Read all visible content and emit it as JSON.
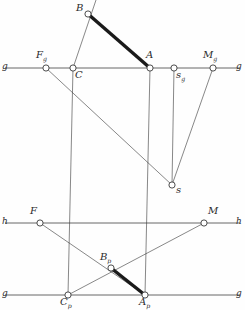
{
  "figure": {
    "type": "descriptive-geometry-construction",
    "width": 245,
    "height": 310,
    "background": "#fefefe",
    "ink_color": "#3a3a3a",
    "thick_color": "#1a1a1a",
    "node_fill": "#ffffff",
    "axes": {
      "g_upper": {
        "label_left": "g",
        "label_right": "g",
        "y": 68,
        "x1": 5,
        "x2": 240
      },
      "h_middle": {
        "label_left": "h",
        "label_right": "h",
        "y": 223,
        "x1": 5,
        "x2": 240
      },
      "g_lower": {
        "label_left": "g",
        "label_right": "g",
        "y": 295,
        "x1": 5,
        "x2": 240
      }
    },
    "points": [
      {
        "name": "B",
        "label": "B",
        "sub": "",
        "x": 88,
        "y": 14,
        "lx": 76,
        "ly": 3
      },
      {
        "name": "Fg",
        "label": "F",
        "sub": "g",
        "x": 46,
        "y": 68,
        "lx": 36,
        "ly": 50
      },
      {
        "name": "C",
        "label": "C",
        "sub": "",
        "x": 73,
        "y": 68,
        "lx": 75,
        "ly": 70
      },
      {
        "name": "A",
        "label": "A",
        "sub": "",
        "x": 150,
        "y": 68,
        "lx": 146,
        "ly": 50
      },
      {
        "name": "sg",
        "label": "s",
        "sub": "g",
        "x": 174,
        "y": 68,
        "lx": 176,
        "ly": 70
      },
      {
        "name": "Mg",
        "label": "M",
        "sub": "g",
        "x": 213,
        "y": 68,
        "lx": 203,
        "ly": 50
      },
      {
        "name": "s",
        "label": "s",
        "sub": "",
        "x": 172,
        "y": 185,
        "lx": 176,
        "ly": 185
      },
      {
        "name": "F",
        "label": "F",
        "sub": "",
        "x": 40,
        "y": 223,
        "lx": 30,
        "ly": 206
      },
      {
        "name": "M",
        "label": "M",
        "sub": "",
        "x": 204,
        "y": 223,
        "lx": 208,
        "ly": 206
      },
      {
        "name": "Bp",
        "label": "B",
        "sub": "p",
        "x": 111,
        "y": 268,
        "lx": 100,
        "ly": 252
      },
      {
        "name": "Cp",
        "label": "C",
        "sub": "p",
        "x": 68,
        "y": 295,
        "lx": 60,
        "ly": 297
      },
      {
        "name": "Ap",
        "label": "A",
        "sub": "p",
        "x": 145,
        "y": 295,
        "lx": 139,
        "ly": 297
      }
    ],
    "thick_segments": [
      {
        "name": "segment-BA",
        "x1": 88,
        "y1": 14,
        "x2": 150,
        "y2": 68
      },
      {
        "name": "segment-Bp-Ap",
        "x1": 111,
        "y1": 268,
        "x2": 145,
        "y2": 295
      }
    ],
    "thin_segments": [
      {
        "name": "ray-through-B-C-extended",
        "x1": 96,
        "y1": 0,
        "x2": 73,
        "y2": 68
      },
      {
        "name": "line-Fg-to-s-ray",
        "x1": 46,
        "y1": 68,
        "x2": 172,
        "y2": 185
      },
      {
        "name": "vertical-C-down",
        "x1": 73,
        "y1": 68,
        "x2": 68,
        "y2": 295
      },
      {
        "name": "vertical-A-down",
        "x1": 150,
        "y1": 68,
        "x2": 145,
        "y2": 295
      },
      {
        "name": "vertical-sg-to-s",
        "x1": 174,
        "y1": 68,
        "x2": 172,
        "y2": 185
      },
      {
        "name": "line-Mg-to-s",
        "x1": 213,
        "y1": 68,
        "x2": 172,
        "y2": 185
      },
      {
        "name": "line-F-to-Ap",
        "x1": 40,
        "y1": 223,
        "x2": 145,
        "y2": 295
      },
      {
        "name": "line-M-to-Cp",
        "x1": 204,
        "y1": 223,
        "x2": 68,
        "y2": 295
      }
    ]
  }
}
